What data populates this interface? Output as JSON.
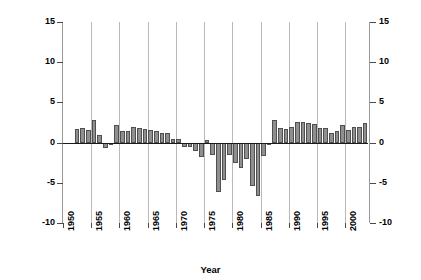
{
  "chart_data": {
    "type": "bar",
    "title": "",
    "xlabel": "Year",
    "ylabel": "Percent",
    "ylim": [
      -10,
      15
    ],
    "xlim": [
      1950,
      2004
    ],
    "ytick_labels_left": [
      "15",
      "10",
      "5",
      "0",
      "-5",
      "-10"
    ],
    "ytick_labels_right": [
      "15",
      "10",
      "5",
      "0",
      "-5",
      "-10"
    ],
    "ytick_values": [
      15,
      10,
      5,
      0,
      -5,
      -10
    ],
    "xtick_labels": [
      "1950",
      "1955",
      "1960",
      "1965",
      "1970",
      "1975",
      "1980",
      "1985",
      "1990",
      "1995",
      "2000"
    ],
    "xtick_values": [
      1950,
      1955,
      1960,
      1965,
      1970,
      1975,
      1980,
      1985,
      1990,
      1995,
      2000
    ],
    "grid": "vertical-only",
    "legend": "none",
    "bar_fill_color": "#8f8f8f",
    "bar_edge_color": "#4f4f4f",
    "gridline_color": "#b9b9b9",
    "axis_color": "#9a9a9a",
    "zero_line_color": "#1a1a1a",
    "categories": [
      1952,
      1953,
      1954,
      1955,
      1956,
      1957,
      1958,
      1959,
      1960,
      1961,
      1962,
      1963,
      1964,
      1965,
      1966,
      1967,
      1968,
      1969,
      1970,
      1971,
      1972,
      1973,
      1974,
      1975,
      1976,
      1977,
      1978,
      1979,
      1980,
      1981,
      1982,
      1983,
      1984,
      1985,
      1986,
      1987,
      1988,
      1989,
      1990,
      1991,
      1992,
      1993,
      1994,
      1995,
      1996,
      1997,
      1998,
      1999,
      2000,
      2001,
      2002,
      2003
    ],
    "values": [
      1.7,
      1.8,
      1.6,
      2.8,
      1.0,
      -0.7,
      0.0,
      2.2,
      1.5,
      1.5,
      1.9,
      1.8,
      1.7,
      1.6,
      1.5,
      1.2,
      1.2,
      0.4,
      0.4,
      -0.5,
      -0.5,
      -1.0,
      -1.8,
      0.3,
      -1.5,
      -6.1,
      -4.7,
      -1.6,
      -2.6,
      -3.1,
      -2.0,
      -5.4,
      -6.7,
      -1.7,
      -0.3,
      2.8,
      1.8,
      1.7,
      2.0,
      2.6,
      2.6,
      2.5,
      2.3,
      1.8,
      1.8,
      1.2,
      1.5,
      2.2,
      1.6,
      2.0,
      2.0,
      2.4
    ]
  },
  "axes": {
    "y_title": "Percent",
    "x_title": "Year"
  }
}
